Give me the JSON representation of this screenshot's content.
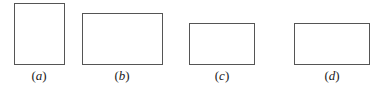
{
  "figure": {
    "panels": [
      {
        "id": "a",
        "label_open": "(",
        "letter": "a",
        "label_close": ")",
        "shape": "rectangle",
        "orientation": "portrait"
      },
      {
        "id": "b",
        "label_open": "(",
        "letter": "b",
        "label_close": ")",
        "shape": "rectangle",
        "orientation": "landscape"
      },
      {
        "id": "c",
        "label_open": "(",
        "letter": "c",
        "label_close": ")",
        "shape": "rectangle",
        "orientation": "landscape"
      },
      {
        "id": "d",
        "label_open": "(",
        "letter": "d",
        "label_close": ")",
        "shape": "rectangle",
        "orientation": "landscape"
      }
    ],
    "colors": {
      "stroke": "#555555",
      "background": "#ffffff",
      "text": "#222222"
    }
  }
}
